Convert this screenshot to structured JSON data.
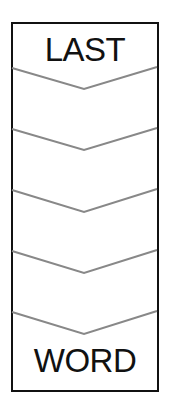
{
  "diagram": {
    "type": "word-ladder",
    "top_word": "LAST",
    "bottom_word": "WORD",
    "blank_rungs": 4,
    "chevron_count": 5,
    "colors": {
      "border": "#111111",
      "chevron": "#888888",
      "text": "#111111",
      "background": "#ffffff"
    }
  }
}
